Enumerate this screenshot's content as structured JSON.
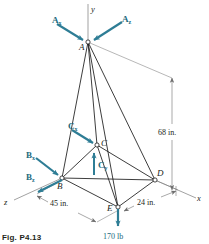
{
  "figure": {
    "caption": "Fig. P4.13",
    "colors": {
      "force_arrow": "#2e7d95",
      "force_label": "#1b6b7e",
      "member_line": "#1a1a1a",
      "dimension_line": "#6e6e6e",
      "background": "#ffffff"
    },
    "axes": [
      {
        "name": "y-axis",
        "label": "y"
      },
      {
        "name": "x-axis",
        "label": "x"
      },
      {
        "name": "z-axis",
        "label": "z"
      }
    ],
    "nodes": [
      {
        "id": "A",
        "label": "A",
        "x": 88,
        "y": 42
      },
      {
        "id": "B",
        "label": "B",
        "x": 62,
        "y": 178
      },
      {
        "id": "C",
        "label": "C",
        "x": 97,
        "y": 145
      },
      {
        "id": "D",
        "label": "D",
        "x": 155,
        "y": 180
      },
      {
        "id": "E",
        "label": "E",
        "x": 118,
        "y": 207
      }
    ],
    "forces": [
      {
        "id": "Ax",
        "base": "A",
        "sub": "x",
        "label": "A",
        "subscript": "x"
      },
      {
        "id": "Az",
        "base": "A",
        "sub": "z",
        "label": "A",
        "subscript": "z"
      },
      {
        "id": "Bx",
        "base": "B",
        "sub": "x",
        "label": "B",
        "subscript": "x"
      },
      {
        "id": "Bz",
        "base": "B",
        "sub": "z",
        "label": "B",
        "subscript": "z"
      },
      {
        "id": "Cx",
        "base": "C",
        "sub": "x",
        "label": "C",
        "subscript": "x"
      },
      {
        "id": "Cy",
        "base": "C",
        "sub": "y",
        "label": "C",
        "subscript": "y"
      }
    ],
    "load": {
      "label": "170 lb",
      "applied_at": "E",
      "direction": "down"
    },
    "dimensions": [
      {
        "id": "height",
        "label": "68 in.",
        "orientation": "vertical"
      },
      {
        "id": "span-left",
        "label": "45 in.",
        "orientation": "oblique"
      },
      {
        "id": "span-right",
        "label": "24 in.",
        "orientation": "oblique"
      }
    ]
  }
}
